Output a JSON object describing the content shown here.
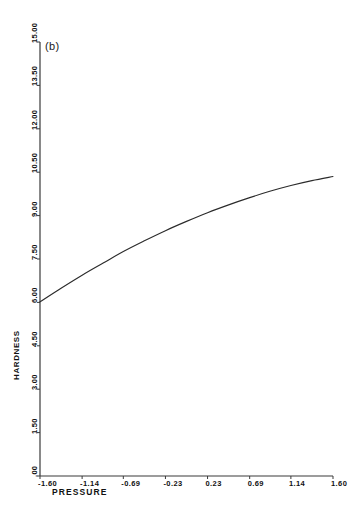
{
  "figure": {
    "panel_label": "(b)",
    "background_color": "#ffffff",
    "line_color": "#2b2b2b",
    "axis_color": "#3a3a3a",
    "text_color": "#111111"
  },
  "chart_data": {
    "type": "line",
    "title": "(b)",
    "xlabel": "PRESSURE",
    "ylabel": "HARDNESS",
    "xlim": [
      -1.6,
      1.6
    ],
    "ylim": [
      0.0,
      15.0
    ],
    "grid": false,
    "legend": null,
    "xticks": [
      -1.6,
      -1.14,
      -0.69,
      -0.23,
      0.23,
      0.69,
      1.14,
      1.6
    ],
    "xtick_labels": [
      "-1.60",
      "-1.14",
      "-0.69",
      "-0.23",
      "0.23",
      "0.69",
      "1.14",
      "1.60"
    ],
    "yticks": [
      0.0,
      1.5,
      3.0,
      4.5,
      6.0,
      7.5,
      9.0,
      10.5,
      12.0,
      13.5,
      15.0
    ],
    "ytick_labels": [
      ".00",
      "1.50",
      "3.00",
      "4.50",
      "6.00",
      "7.50",
      "9.00",
      "10.50",
      "12.00",
      "13.50",
      "15.00"
    ],
    "series": [
      {
        "name": "hardness vs pressure",
        "x": [
          -1.6,
          -1.37,
          -1.14,
          -0.91,
          -0.69,
          -0.46,
          -0.23,
          0.0,
          0.23,
          0.46,
          0.69,
          0.91,
          1.14,
          1.37,
          1.6
        ],
        "values": [
          6.02,
          6.49,
          6.94,
          7.36,
          7.76,
          8.13,
          8.48,
          8.8,
          9.1,
          9.37,
          9.62,
          9.84,
          10.04,
          10.21,
          10.35
        ]
      }
    ]
  }
}
